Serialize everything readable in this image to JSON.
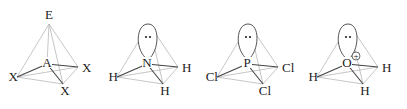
{
  "figure": {
    "type": "tetrahedral-molecular-geometry",
    "molecules": [
      {
        "name": "generic",
        "center": "A",
        "apex": "E",
        "lone_pair": false,
        "charge": "",
        "substituents": [
          "X",
          "X",
          "X"
        ]
      },
      {
        "name": "ammonia",
        "center": "N",
        "apex": "",
        "lone_pair": true,
        "charge": "",
        "substituents": [
          "H",
          "H",
          "H"
        ]
      },
      {
        "name": "phosphorus-trichloride",
        "center": "P",
        "apex": "",
        "lone_pair": true,
        "charge": "",
        "substituents": [
          "Cl",
          "Cl",
          "Cl"
        ]
      },
      {
        "name": "hydronium",
        "center": "O",
        "apex": "",
        "lone_pair": true,
        "charge": "+",
        "substituents": [
          "H",
          "H",
          "H"
        ]
      }
    ]
  }
}
